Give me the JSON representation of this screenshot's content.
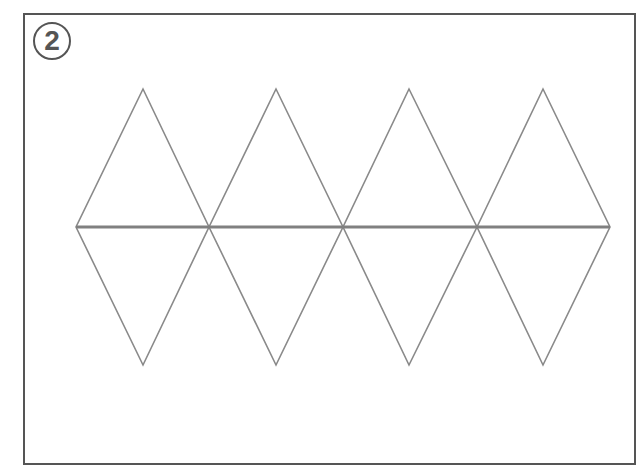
{
  "figure": {
    "label": "2",
    "stroke_color": "#8a8a8a",
    "midline_color": "#808080",
    "frame_color": "#555555",
    "rhombi": [
      {
        "top": [
          143,
          89
        ],
        "left": [
          76,
          227
        ],
        "right": [
          209,
          227
        ],
        "bottom": [
          143,
          365
        ]
      },
      {
        "top": [
          276,
          89
        ],
        "left": [
          209,
          227
        ],
        "right": [
          343,
          227
        ],
        "bottom": [
          276,
          365
        ]
      },
      {
        "top": [
          409,
          89
        ],
        "left": [
          343,
          227
        ],
        "right": [
          477,
          227
        ],
        "bottom": [
          409,
          365
        ]
      },
      {
        "top": [
          543,
          89
        ],
        "left": [
          477,
          227
        ],
        "right": [
          610,
          227
        ],
        "bottom": [
          543,
          365
        ]
      }
    ]
  }
}
